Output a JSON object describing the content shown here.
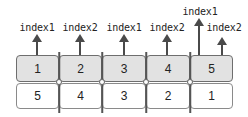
{
  "diagram": {
    "top_row": {
      "fill_color": "#e2e2e2",
      "cells": [
        "1",
        "2",
        "3",
        "4",
        "5"
      ]
    },
    "bottom_row": {
      "fill_color": "#ffffff",
      "cells": [
        "5",
        "4",
        "3",
        "2",
        "1"
      ]
    },
    "pointers": [
      {
        "label": "index1",
        "column": 1,
        "height": "short"
      },
      {
        "label": "index2",
        "column": 2,
        "height": "short"
      },
      {
        "label": "index1",
        "column": 3,
        "height": "short"
      },
      {
        "label": "index2",
        "column": 4,
        "height": "short"
      },
      {
        "label": "index1",
        "column": 5,
        "height": "tall"
      },
      {
        "label": "index2",
        "column": 5,
        "height": "short"
      }
    ],
    "arrow_color": "#4a4a4a"
  }
}
